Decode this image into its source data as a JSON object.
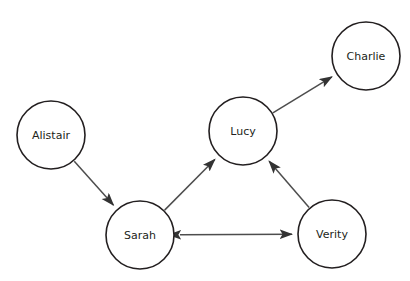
{
  "canvas": {
    "width": 410,
    "height": 281,
    "background": "#ffffff"
  },
  "style": {
    "node_stroke": "#231f20",
    "node_fill": "#ffffff",
    "node_stroke_width": 1.6,
    "node_radius": 34,
    "label_color": "#231f20",
    "edge_color": "#4d4d4d",
    "edge_width": 1.5,
    "arrow_color": "#333333"
  },
  "nodes": [
    {
      "id": "alistair",
      "label": "Alistair",
      "cx": 51,
      "cy": 135,
      "r": 34
    },
    {
      "id": "sarah",
      "label": "Sarah",
      "cx": 140,
      "cy": 235,
      "r": 34
    },
    {
      "id": "lucy",
      "label": "Lucy",
      "cx": 243,
      "cy": 131,
      "r": 34
    },
    {
      "id": "verity",
      "label": "Verity",
      "cx": 332,
      "cy": 234,
      "r": 34
    },
    {
      "id": "charlie",
      "label": "Charlie",
      "cx": 366,
      "cy": 56,
      "r": 34
    }
  ],
  "edges": [
    {
      "id": "alistair-sarah",
      "from": "alistair",
      "to": "sarah",
      "direction": "forward"
    },
    {
      "id": "sarah-lucy",
      "from": "sarah",
      "to": "lucy",
      "direction": "forward"
    },
    {
      "id": "verity-lucy",
      "from": "verity",
      "to": "lucy",
      "direction": "forward"
    },
    {
      "id": "lucy-charlie",
      "from": "lucy",
      "to": "charlie",
      "direction": "forward"
    },
    {
      "id": "sarah-verity",
      "from": "sarah",
      "to": "verity",
      "direction": "both"
    }
  ],
  "footer": {
    "caption": ""
  }
}
